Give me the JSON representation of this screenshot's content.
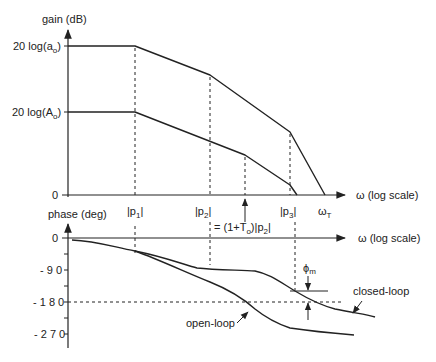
{
  "gain_plot": {
    "y_axis_label": "gain (dB)",
    "x_axis_label": "ω (log scale)",
    "y_ticks": {
      "a0": {
        "prefix": "20 log(a",
        "sub": "o",
        "suffix": ")"
      },
      "A0": {
        "prefix": "20 log(A",
        "sub": "o",
        "suffix": ")"
      },
      "zero": "0"
    },
    "x_ticks": {
      "p1": {
        "prefix": "|p",
        "sub": "1",
        "suffix": "|"
      },
      "p2": {
        "prefix": "|p",
        "sub": "2",
        "suffix": "|"
      },
      "p3": {
        "prefix": "|p",
        "sub": "3",
        "suffix": "|"
      },
      "wT": {
        "prefix": "ω",
        "sub": "T"
      }
    },
    "annotation": {
      "prefix": "= (1+T",
      "sub": "o",
      "suffix": ")|p",
      "sub2": "2",
      "suffix2": "|"
    },
    "curves": [
      "open-loop gain (20 log a₀)",
      "closed-loop gain (20 log A₀)"
    ]
  },
  "phase_plot": {
    "y_axis_label": "phase (deg)",
    "x_axis_label": "ω (log scale)",
    "y_ticks": [
      "0",
      "- 9 0",
      "- 1 8 0",
      "- 2 7 0"
    ],
    "margin_label": {
      "prefix": "ϕ",
      "sub": "m"
    },
    "curve_labels": {
      "closed": "closed-loop",
      "open": "open-loop"
    }
  },
  "colors": {
    "ink": "#222222",
    "background": "#ffffff"
  }
}
